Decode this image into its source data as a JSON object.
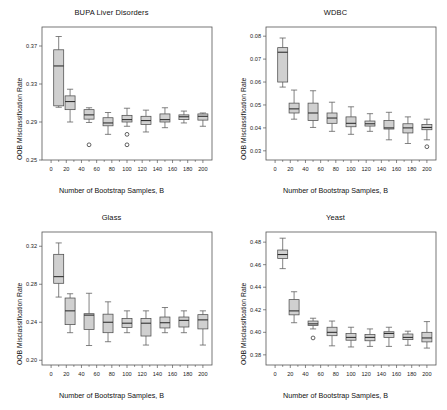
{
  "figure": {
    "width": 447,
    "height": 410,
    "background": "#ffffff",
    "box_fill": "#c8c8c8",
    "box_stroke": "#4d4d4d",
    "axis_color": "#555555"
  },
  "shared": {
    "xlabel": "Number of Bootstrap Samples, B",
    "ylabel": "OOB Misclassification Rate",
    "xticks": [
      0,
      20,
      40,
      60,
      80,
      100,
      120,
      140,
      160,
      180,
      200
    ],
    "xticklabels": [
      "0",
      "20",
      "40",
      "60",
      "80",
      "100",
      "120",
      "140",
      "160",
      "180",
      "200"
    ]
  },
  "chart_data": [
    {
      "type": "box",
      "panel": "top-left",
      "title": "BUPA Liver Disorders",
      "xlabel": "Number of Bootstrap Samples, B",
      "ylabel": "OOB Misclassification Rate",
      "xlim": [
        -12,
        212
      ],
      "ylim": [
        0.25,
        0.39
      ],
      "yticks": [
        0.25,
        0.29,
        0.33,
        0.37
      ],
      "yticklabels": [
        "0.25",
        "0.29",
        "0.33",
        "0.37"
      ],
      "grid": false,
      "legend": "none",
      "categories": [
        10,
        25,
        50,
        75,
        100,
        125,
        150,
        175,
        200
      ],
      "boxes": [
        {
          "x": 10,
          "whislo": 0.3055,
          "q1": 0.307,
          "med": 0.349,
          "q3": 0.366,
          "whishi": 0.38,
          "outliers": []
        },
        {
          "x": 25,
          "whislo": 0.29,
          "q1": 0.303,
          "med": 0.3115,
          "q3": 0.3175,
          "whishi": 0.3245,
          "outliers": []
        },
        {
          "x": 50,
          "whislo": 0.2895,
          "q1": 0.293,
          "med": 0.2975,
          "q3": 0.303,
          "whishi": 0.305,
          "outliers": [
            0.266
          ]
        },
        {
          "x": 75,
          "whislo": 0.277,
          "q1": 0.286,
          "med": 0.289,
          "q3": 0.2945,
          "whishi": 0.3,
          "outliers": []
        },
        {
          "x": 100,
          "whislo": 0.2855,
          "q1": 0.29,
          "med": 0.2925,
          "q3": 0.297,
          "whishi": 0.3045,
          "outliers": [
            0.277,
            0.266
          ]
        },
        {
          "x": 125,
          "whislo": 0.2795,
          "q1": 0.2875,
          "med": 0.2915,
          "q3": 0.296,
          "whishi": 0.3025,
          "outliers": []
        },
        {
          "x": 150,
          "whislo": 0.284,
          "q1": 0.29,
          "med": 0.2925,
          "q3": 0.2985,
          "whishi": 0.305,
          "outliers": []
        },
        {
          "x": 175,
          "whislo": 0.289,
          "q1": 0.2925,
          "med": 0.2955,
          "q3": 0.2975,
          "whishi": 0.3015,
          "outliers": []
        },
        {
          "x": 200,
          "whislo": 0.2855,
          "q1": 0.292,
          "med": 0.296,
          "q3": 0.2985,
          "whishi": 0.2995,
          "outliers": []
        }
      ]
    },
    {
      "type": "box",
      "panel": "top-right",
      "title": "WDBC",
      "xlabel": "Number of Bootstrap Samples, B",
      "ylabel": "OOB Misclassification Rate",
      "xlim": [
        -12,
        212
      ],
      "ylim": [
        0.026,
        0.084
      ],
      "yticks": [
        0.03,
        0.04,
        0.05,
        0.06,
        0.07,
        0.08
      ],
      "yticklabels": [
        "0.03",
        "0.04",
        "0.05",
        "0.06",
        "0.07",
        "0.08"
      ],
      "grid": false,
      "legend": "none",
      "categories": [
        10,
        25,
        50,
        75,
        100,
        125,
        150,
        175,
        200
      ],
      "boxes": [
        {
          "x": 10,
          "whislo": 0.0578,
          "q1": 0.06,
          "med": 0.073,
          "q3": 0.075,
          "whishi": 0.0792,
          "outliers": []
        },
        {
          "x": 25,
          "whislo": 0.0438,
          "q1": 0.0465,
          "med": 0.0483,
          "q3": 0.0508,
          "whishi": 0.0565,
          "outliers": []
        },
        {
          "x": 50,
          "whislo": 0.0402,
          "q1": 0.0432,
          "med": 0.0465,
          "q3": 0.0508,
          "whishi": 0.0562,
          "outliers": []
        },
        {
          "x": 75,
          "whislo": 0.0385,
          "q1": 0.042,
          "med": 0.0443,
          "q3": 0.0465,
          "whishi": 0.0512,
          "outliers": []
        },
        {
          "x": 100,
          "whislo": 0.0372,
          "q1": 0.0405,
          "med": 0.042,
          "q3": 0.0448,
          "whishi": 0.0492,
          "outliers": []
        },
        {
          "x": 125,
          "whislo": 0.0385,
          "q1": 0.0408,
          "med": 0.0418,
          "q3": 0.043,
          "whishi": 0.0462,
          "outliers": []
        },
        {
          "x": 150,
          "whislo": 0.0348,
          "q1": 0.0395,
          "med": 0.04,
          "q3": 0.0432,
          "whishi": 0.0468,
          "outliers": []
        },
        {
          "x": 175,
          "whislo": 0.0332,
          "q1": 0.0378,
          "med": 0.04,
          "q3": 0.0418,
          "whishi": 0.0448,
          "outliers": []
        },
        {
          "x": 200,
          "whislo": 0.0348,
          "q1": 0.0392,
          "med": 0.0402,
          "q3": 0.0415,
          "whishi": 0.0438,
          "outliers": [
            0.0318
          ]
        }
      ]
    },
    {
      "type": "box",
      "panel": "bottom-left",
      "title": "Glass",
      "xlabel": "Number of Bootstrap Samples, B",
      "ylabel": "OOB Misclassification Rate",
      "xlim": [
        -12,
        212
      ],
      "ylim": [
        0.195,
        0.335
      ],
      "yticks": [
        0.2,
        0.24,
        0.28,
        0.32
      ],
      "yticklabels": [
        "0.20",
        "0.24",
        "0.28",
        "0.32"
      ],
      "grid": false,
      "legend": "none",
      "categories": [
        10,
        25,
        50,
        75,
        100,
        125,
        150,
        175,
        200
      ],
      "boxes": [
        {
          "x": 10,
          "whislo": 0.2665,
          "q1": 0.281,
          "med": 0.288,
          "q3": 0.3115,
          "whishi": 0.3235,
          "outliers": []
        },
        {
          "x": 25,
          "whislo": 0.229,
          "q1": 0.2375,
          "med": 0.252,
          "q3": 0.2655,
          "whishi": 0.27,
          "outliers": []
        },
        {
          "x": 50,
          "whislo": 0.2155,
          "q1": 0.2325,
          "med": 0.2475,
          "q3": 0.249,
          "whishi": 0.2705,
          "outliers": []
        },
        {
          "x": 75,
          "whislo": 0.2195,
          "q1": 0.229,
          "med": 0.24,
          "q3": 0.2485,
          "whishi": 0.2615,
          "outliers": []
        },
        {
          "x": 100,
          "whislo": 0.229,
          "q1": 0.2345,
          "med": 0.239,
          "q3": 0.244,
          "whishi": 0.252,
          "outliers": []
        },
        {
          "x": 125,
          "whislo": 0.216,
          "q1": 0.2255,
          "med": 0.239,
          "q3": 0.244,
          "whishi": 0.252,
          "outliers": []
        },
        {
          "x": 150,
          "whislo": 0.229,
          "q1": 0.234,
          "med": 0.2395,
          "q3": 0.2455,
          "whishi": 0.2555,
          "outliers": []
        },
        {
          "x": 175,
          "whislo": 0.229,
          "q1": 0.235,
          "med": 0.242,
          "q3": 0.2455,
          "whishi": 0.252,
          "outliers": []
        },
        {
          "x": 200,
          "whislo": 0.216,
          "q1": 0.233,
          "med": 0.2425,
          "q3": 0.248,
          "whishi": 0.252,
          "outliers": []
        }
      ]
    },
    {
      "type": "box",
      "panel": "bottom-right",
      "title": "Yeast",
      "xlabel": "Number of Bootstrap Samples, B",
      "ylabel": "OOB Misclassification Rate",
      "xlim": [
        -12,
        212
      ],
      "ylim": [
        0.371,
        0.489
      ],
      "yticks": [
        0.38,
        0.4,
        0.42,
        0.44,
        0.46,
        0.48
      ],
      "yticklabels": [
        "0.38",
        "0.40",
        "0.42",
        "0.44",
        "0.46",
        "0.48"
      ],
      "grid": false,
      "legend": "none",
      "categories": [
        10,
        25,
        50,
        75,
        100,
        125,
        150,
        175,
        200
      ],
      "boxes": [
        {
          "x": 10,
          "whislo": 0.4565,
          "q1": 0.4655,
          "med": 0.469,
          "q3": 0.473,
          "whishi": 0.4835,
          "outliers": []
        },
        {
          "x": 25,
          "whislo": 0.4085,
          "q1": 0.4155,
          "med": 0.419,
          "q3": 0.429,
          "whishi": 0.436,
          "outliers": []
        },
        {
          "x": 50,
          "whislo": 0.403,
          "q1": 0.406,
          "med": 0.4075,
          "q3": 0.41,
          "whishi": 0.4125,
          "outliers": [
            0.395
          ]
        },
        {
          "x": 75,
          "whislo": 0.388,
          "q1": 0.397,
          "med": 0.4,
          "q3": 0.4045,
          "whishi": 0.41,
          "outliers": []
        },
        {
          "x": 100,
          "whislo": 0.387,
          "q1": 0.393,
          "med": 0.3955,
          "q3": 0.399,
          "whishi": 0.4045,
          "outliers": []
        },
        {
          "x": 125,
          "whislo": 0.3875,
          "q1": 0.3925,
          "med": 0.3955,
          "q3": 0.398,
          "whishi": 0.403,
          "outliers": []
        },
        {
          "x": 150,
          "whislo": 0.3875,
          "q1": 0.3955,
          "med": 0.399,
          "q3": 0.4005,
          "whishi": 0.4045,
          "outliers": []
        },
        {
          "x": 175,
          "whislo": 0.3885,
          "q1": 0.3935,
          "med": 0.3955,
          "q3": 0.3985,
          "whishi": 0.401,
          "outliers": []
        },
        {
          "x": 200,
          "whislo": 0.386,
          "q1": 0.3915,
          "med": 0.395,
          "q3": 0.4,
          "whishi": 0.4095,
          "outliers": []
        }
      ]
    }
  ]
}
